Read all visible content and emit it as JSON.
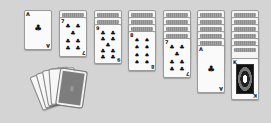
{
  "game": {
    "name": "Solitaire",
    "background_color": "#d4d4d4"
  },
  "piles": [
    {
      "id": "foundation-1",
      "face_down": 0,
      "top_card": {
        "rank": "A",
        "suit": "♣",
        "pips": 1
      }
    },
    {
      "id": "tableau-2",
      "face_down": 1,
      "top_card": {
        "rank": "7",
        "suit": "♣",
        "pips": 7
      }
    },
    {
      "id": "tableau-3",
      "face_down": 2,
      "top_card": {
        "rank": "9",
        "suit": "♣",
        "pips": 9
      }
    },
    {
      "id": "tableau-4",
      "face_down": 3,
      "top_card": {
        "rank": "8",
        "suit": "♠",
        "pips": 8
      }
    },
    {
      "id": "tableau-5",
      "face_down": 4,
      "top_card": {
        "rank": "7",
        "suit": "♣",
        "pips": 7
      }
    },
    {
      "id": "tableau-6",
      "face_down": 5,
      "top_card": {
        "rank": "A",
        "suit": "♣",
        "pips": 1
      }
    },
    {
      "id": "tableau-7",
      "face_down": 6,
      "top_card": {
        "rank": "K",
        "suit": "♠",
        "pips": 0,
        "face": true
      }
    }
  ],
  "stock": {
    "fanned_cards": 5
  }
}
